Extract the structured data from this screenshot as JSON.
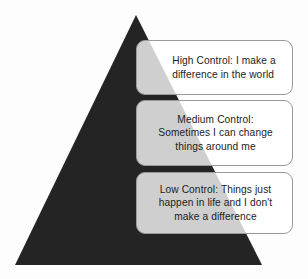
{
  "diagram": {
    "type": "pyramid",
    "title": "",
    "background_color": "#fdfdfd",
    "pyramid": {
      "shape_name": "triangle",
      "fill_color": "#242424",
      "apex": {
        "x": 136,
        "y": 15
      },
      "base_left": {
        "x": 15,
        "y": 265
      },
      "base_right": {
        "x": 262,
        "y": 265
      }
    },
    "callouts": [
      {
        "id": "high",
        "level_label": "High Control",
        "text": "High Control: I make a\ndifference in the world",
        "align": "left"
      },
      {
        "id": "medium",
        "level_label": "Medium Control",
        "text": "Medium Control:\nSometimes I can change\nthings around me",
        "align": "center"
      },
      {
        "id": "low",
        "level_label": "Low Control",
        "text": "Low Control: Things just\nhappen in life and I don't\nmake a difference",
        "align": "center"
      }
    ],
    "colors": {
      "pyramid_fill": "#242424",
      "callout_border": "#9a9a9a",
      "callout_fill": "rgba(255,255,255,0.78)",
      "overlap_gray": "#c8c8c8",
      "text": "#1c1c1c"
    }
  }
}
